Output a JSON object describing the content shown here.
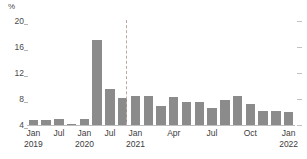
{
  "chart_data": {
    "type": "bar",
    "title": "",
    "subtitle": "",
    "xlabel": "",
    "ylabel": "",
    "y_unit": "%",
    "ylim": [
      4,
      20
    ],
    "yticks": [
      4,
      8,
      12,
      16,
      20
    ],
    "ytick_labels": [
      "4",
      "8",
      "12",
      "16",
      "20"
    ],
    "grid": false,
    "legend": "none",
    "bar_color": "#8b8b8b",
    "axis_color": "#bdbdbd",
    "divider_color": "#b9a9a0",
    "divider_note": "dashed vertical separator between quarterly and monthly periods, positioned before Jan 2021",
    "xtick_labels": [
      {
        "month": "Jan",
        "year": "2019"
      },
      {
        "month": "Jul",
        "year": ""
      },
      {
        "month": "Jan",
        "year": "2020"
      },
      {
        "month": "Jul",
        "year": ""
      },
      {
        "month": "Jan",
        "year": "2021"
      },
      {
        "month": "Apr",
        "year": ""
      },
      {
        "month": "Jul",
        "year": ""
      },
      {
        "month": "Oct",
        "year": ""
      },
      {
        "month": "Jan",
        "year": "2022"
      }
    ],
    "series": [
      {
        "name": "Rate",
        "segments": [
          {
            "name": "quarterly",
            "categories": [
              "Jan 2019",
              "Apr 2019",
              "Jul 2019",
              "Oct 2019",
              "Jan 2020",
              "Apr 2020",
              "Jul 2020",
              "Oct 2020"
            ],
            "values": [
              4.8,
              4.7,
              5.0,
              4.2,
              5.0,
              17.1,
              9.5,
              8.2
            ]
          },
          {
            "name": "monthly",
            "categories": [
              "Jan 2021",
              "Feb 2021",
              "Mar 2021",
              "Apr 2021",
              "May 2021",
              "Jun 2021",
              "Jul 2021",
              "Aug 2021",
              "Sep 2021",
              "Oct 2021",
              "Nov 2021",
              "Dec 2021",
              "Jan 2022"
            ],
            "values": [
              8.4,
              8.4,
              6.9,
              8.3,
              7.5,
              7.5,
              6.6,
              7.9,
              8.5,
              7.2,
              6.2,
              6.2,
              6.0
            ]
          }
        ]
      }
    ]
  }
}
